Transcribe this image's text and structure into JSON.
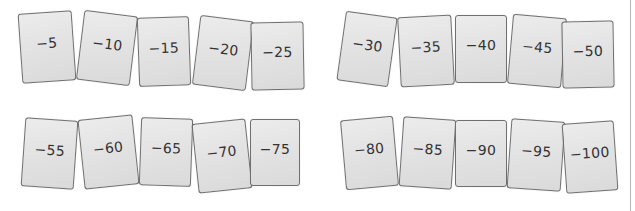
{
  "cards": [
    {
      "label": "−5",
      "x": 20,
      "y": 12,
      "w": 54,
      "h": 70,
      "rot": -4
    },
    {
      "label": "−10",
      "x": 80,
      "y": 13,
      "w": 54,
      "h": 70,
      "rot": 7
    },
    {
      "label": "−15",
      "x": 138,
      "y": 17,
      "w": 52,
      "h": 69,
      "rot": -2
    },
    {
      "label": "−20",
      "x": 196,
      "y": 18,
      "w": 54,
      "h": 70,
      "rot": 7
    },
    {
      "label": "−25",
      "x": 251,
      "y": 22,
      "w": 53,
      "h": 68,
      "rot": -1
    },
    {
      "label": "−30",
      "x": 341,
      "y": 14,
      "w": 52,
      "h": 70,
      "rot": 8
    },
    {
      "label": "−35",
      "x": 399,
      "y": 16,
      "w": 54,
      "h": 70,
      "rot": -3
    },
    {
      "label": "−40",
      "x": 455,
      "y": 15,
      "w": 52,
      "h": 68,
      "rot": 0
    },
    {
      "label": "−45",
      "x": 510,
      "y": 16,
      "w": 54,
      "h": 70,
      "rot": 5
    },
    {
      "label": "−50",
      "x": 562,
      "y": 21,
      "w": 52,
      "h": 67,
      "rot": -1
    },
    {
      "label": "−55",
      "x": 23,
      "y": 119,
      "w": 53,
      "h": 69,
      "rot": 4
    },
    {
      "label": "−60",
      "x": 81,
      "y": 117,
      "w": 55,
      "h": 70,
      "rot": -6
    },
    {
      "label": "−65",
      "x": 140,
      "y": 118,
      "w": 52,
      "h": 68,
      "rot": 2
    },
    {
      "label": "−70",
      "x": 195,
      "y": 121,
      "w": 54,
      "h": 70,
      "rot": -6
    },
    {
      "label": "−75",
      "x": 250,
      "y": 119,
      "w": 50,
      "h": 67,
      "rot": 0
    },
    {
      "label": "−80",
      "x": 343,
      "y": 118,
      "w": 53,
      "h": 70,
      "rot": -5
    },
    {
      "label": "−85",
      "x": 401,
      "y": 118,
      "w": 53,
      "h": 70,
      "rot": 4
    },
    {
      "label": "−90",
      "x": 455,
      "y": 120,
      "w": 52,
      "h": 67,
      "rot": 0
    },
    {
      "label": "−95",
      "x": 509,
      "y": 120,
      "w": 54,
      "h": 70,
      "rot": 4
    },
    {
      "label": "−100",
      "x": 564,
      "y": 122,
      "w": 52,
      "h": 70,
      "rot": -4
    }
  ]
}
